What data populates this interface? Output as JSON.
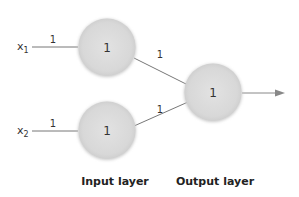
{
  "diagram": {
    "title": "",
    "inputs": [
      {
        "label": "x",
        "subscript": "1",
        "weight": "1"
      },
      {
        "label": "x",
        "subscript": "2",
        "weight": "1"
      }
    ],
    "input_layer": {
      "label": "Input layer",
      "nodes": [
        {
          "value": "1"
        },
        {
          "value": "1"
        }
      ]
    },
    "hidden_to_output_weights": [
      "1",
      "1"
    ],
    "output_layer": {
      "label": "Output layer",
      "nodes": [
        {
          "value": "1"
        }
      ]
    },
    "colors": {
      "node_fill": "#dcdcdc",
      "line": "#777777",
      "arrow": "#888888"
    }
  }
}
